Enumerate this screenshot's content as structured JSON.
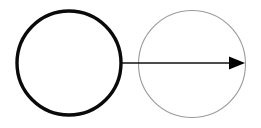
{
  "canvas": {
    "width": 261,
    "height": 128,
    "background_color": "#ffffff",
    "title": "Two circles joined by a rightward arrow"
  },
  "diagram": {
    "type": "schematic",
    "shapes": [
      {
        "id": "source-circle",
        "kind": "circle",
        "role": "source",
        "label": "",
        "center_x": 69,
        "center_y": 63,
        "radius": 52,
        "stroke_color": "#0a0a0a",
        "stroke_width": 3.4,
        "fill_color": "none"
      },
      {
        "id": "target-circle",
        "kind": "circle",
        "role": "target",
        "label": "",
        "center_x": 192,
        "center_y": 64,
        "radius": 53.5,
        "stroke_color": "#9a9a9a",
        "stroke_width": 1.1,
        "fill_color": "none"
      }
    ],
    "connectors": [
      {
        "id": "flow-arrow",
        "kind": "arrow",
        "label": "",
        "direction": "right",
        "start_x": 122,
        "start_y": 63,
        "end_x": 245,
        "end_y": 63,
        "line_color": "#111111",
        "line_width": 1.6,
        "head_length": 16,
        "head_width": 13,
        "head_fill": "#000000"
      }
    ]
  }
}
